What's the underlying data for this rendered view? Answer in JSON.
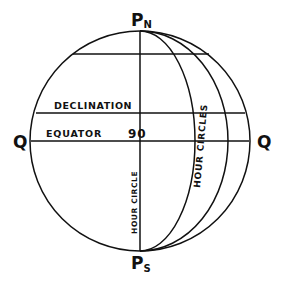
{
  "diagram": {
    "labels": {
      "north_pole": "P",
      "north_pole_sub": "N",
      "south_pole": "P",
      "south_pole_sub": "S",
      "q_left": "Q",
      "q_right": "Q",
      "declination": "DECLINATION",
      "equator": "EQUATOR",
      "angle": "90",
      "hour_circle": "HOUR CIRCLE",
      "hour_circles": "HOUR CIRCLES"
    },
    "colors": {
      "stroke": "#111111",
      "background": "#ffffff"
    }
  }
}
